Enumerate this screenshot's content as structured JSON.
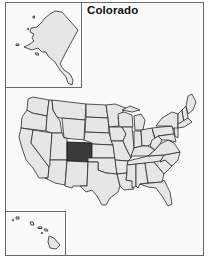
{
  "map": {
    "title": "Colorado",
    "highlighted_state": "Colorado",
    "colors": {
      "state_fill": "#e6e6e6",
      "highlight_fill": "#3a3a3a",
      "border": "#2a2a2a",
      "background": "#fafafa"
    },
    "insets": [
      "Alaska",
      "Hawaii"
    ]
  }
}
